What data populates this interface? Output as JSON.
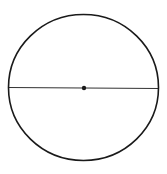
{
  "diagram": {
    "type": "circle-with-diameter",
    "background": "#ffffff",
    "stroke_color": "#1a1a1a",
    "circle": {
      "cx": 83.5,
      "cy": 87.5,
      "rx": 75,
      "ry": 73,
      "stroke_width": 1.6
    },
    "diameter": {
      "x1": 8.5,
      "y1": 87.5,
      "x2": 158.5,
      "y2": 88.5,
      "stroke_width": 0.9
    },
    "center_point": {
      "cx": 84,
      "cy": 88,
      "r": 2.2
    }
  }
}
